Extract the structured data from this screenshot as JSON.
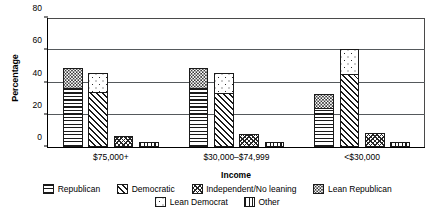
{
  "chart_data": {
    "type": "bar",
    "subtype": "grouped-stacked",
    "title": "",
    "xlabel": "Income",
    "ylabel": "Percentage",
    "ylim": [
      0,
      80
    ],
    "yticks": [
      0,
      20,
      40,
      60,
      80
    ],
    "ytick_labels": [
      "0",
      "20",
      "40",
      "60",
      "80"
    ],
    "grid": true,
    "legend_position": "bottom",
    "categories": [
      "$75,000+",
      "$30,000–$74,999",
      "<$30,000"
    ],
    "series": [
      {
        "name": "Republican",
        "pattern": "horizontal-lines",
        "values": [
          36,
          36,
          24
        ]
      },
      {
        "name": "Lean Republican",
        "pattern": "fine-dots",
        "values": [
          13,
          13,
          9
        ]
      },
      {
        "name": "Democratic",
        "pattern": "diagonal-hatch",
        "values": [
          34,
          33,
          45
        ]
      },
      {
        "name": "Lean Democrat",
        "pattern": "sparse-dots",
        "values": [
          12,
          13,
          16
        ]
      },
      {
        "name": "Independent/No leaning",
        "pattern": "crosshatch",
        "values": [
          7,
          8,
          9
        ]
      },
      {
        "name": "Other",
        "pattern": "vertical-lines",
        "values": [
          3,
          3,
          3
        ]
      }
    ],
    "stacks": [
      {
        "name": "republican-stack",
        "base_series": "Republican",
        "top_series": "Lean Republican",
        "totals": [
          49,
          49,
          33
        ]
      },
      {
        "name": "democratic-stack",
        "base_series": "Democratic",
        "top_series": "Lean Democrat",
        "totals": [
          46,
          46,
          61
        ]
      },
      {
        "name": "independent-bar",
        "base_series": "Independent/No leaning",
        "top_series": null,
        "totals": [
          7,
          8,
          9
        ]
      },
      {
        "name": "other-bar",
        "base_series": "Other",
        "top_series": null,
        "totals": [
          3,
          3,
          3
        ]
      }
    ]
  },
  "axes": {
    "y_title": "Percentage",
    "x_title": "Income",
    "y_ticks": [
      "80",
      "60",
      "40",
      "20",
      "0"
    ],
    "x_group_labels": [
      "$75,000+",
      "$30,000–$74,999",
      "<$30,000"
    ]
  },
  "legend": {
    "row1": [
      {
        "label": "Republican",
        "pattern": "horizontal-lines"
      },
      {
        "label": "Democratic",
        "pattern": "diagonal-hatch"
      },
      {
        "label": "Independent/No leaning",
        "pattern": "crosshatch"
      },
      {
        "label": "Lean Republican",
        "pattern": "fine-dots"
      }
    ],
    "row2": [
      {
        "label": "Lean Democrat",
        "pattern": "sparse-dots"
      },
      {
        "label": "Other",
        "pattern": "vertical-lines"
      }
    ]
  },
  "colors": {
    "axis": "#000000",
    "grid": "#55595c",
    "bar_outline": "#1a1a1a",
    "background": "#ffffff"
  }
}
